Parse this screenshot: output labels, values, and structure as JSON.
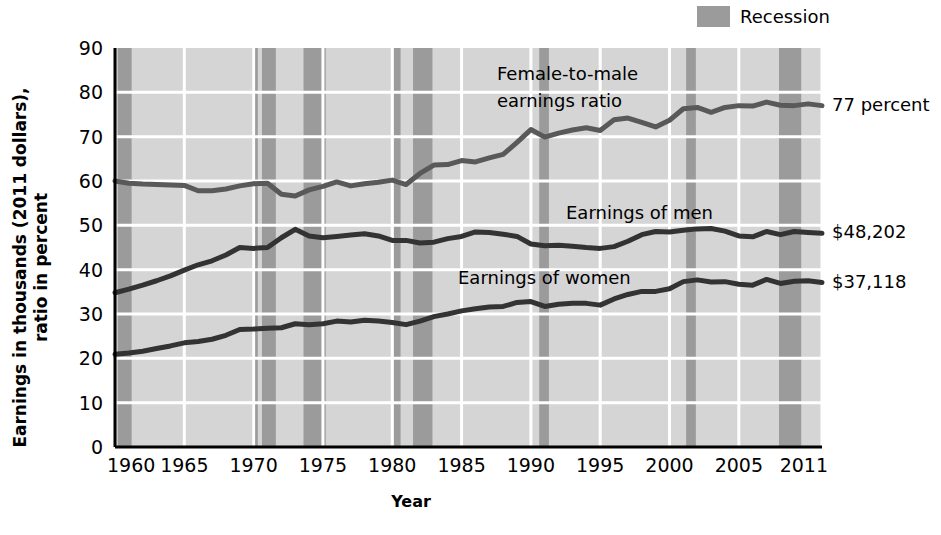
{
  "chart_data": {
    "type": "line",
    "title": "",
    "xlabel": "Year",
    "ylabel": "Earnings in thousands (2011 dollars),\nratio in percent",
    "xlim": [
      1960,
      2011
    ],
    "ylim": [
      0,
      90
    ],
    "grid": true,
    "legend_position": "top-right",
    "xticks": [
      "1960",
      "1965",
      "1970",
      "1975",
      "1980",
      "1985",
      "1990",
      "1995",
      "2000",
      "2005",
      "2011"
    ],
    "xtick_values": [
      1960,
      1965,
      1970,
      1975,
      1980,
      1985,
      1990,
      1995,
      2000,
      2005,
      2011
    ],
    "yticks": [
      "0",
      "10",
      "20",
      "30",
      "40",
      "50",
      "60",
      "70",
      "80",
      "90"
    ],
    "ytick_values": [
      0,
      10,
      20,
      30,
      40,
      50,
      60,
      70,
      80,
      90
    ],
    "legend": [
      {
        "label": "Recession",
        "color": "#9b9b9b",
        "kind": "band"
      }
    ],
    "x": [
      1960,
      1961,
      1962,
      1963,
      1964,
      1965,
      1966,
      1967,
      1968,
      1969,
      1970,
      1971,
      1972,
      1973,
      1974,
      1975,
      1976,
      1977,
      1978,
      1979,
      1980,
      1981,
      1982,
      1983,
      1984,
      1985,
      1986,
      1987,
      1988,
      1989,
      1990,
      1991,
      1992,
      1993,
      1994,
      1995,
      1996,
      1997,
      1998,
      1999,
      2000,
      2001,
      2002,
      2003,
      2004,
      2005,
      2006,
      2007,
      2008,
      2009,
      2010,
      2011
    ],
    "series": [
      {
        "name": "Female-to-male earnings ratio",
        "color": "#595959",
        "unit": "percent",
        "end_label": "77 percent",
        "values": [
          60.0,
          59.5,
          59.3,
          59.2,
          59.1,
          59.0,
          57.8,
          57.8,
          58.2,
          58.9,
          59.4,
          59.5,
          57.0,
          56.6,
          58.0,
          58.8,
          59.8,
          58.9,
          59.4,
          59.7,
          60.2,
          59.2,
          61.7,
          63.6,
          63.7,
          64.6,
          64.3,
          65.2,
          66.0,
          68.7,
          71.6,
          69.9,
          70.8,
          71.5,
          72.0,
          71.4,
          73.8,
          74.2,
          73.2,
          72.2,
          73.7,
          76.3,
          76.6,
          75.5,
          76.6,
          77.0,
          76.9,
          77.8,
          77.1,
          77.0,
          77.4,
          77.0
        ]
      },
      {
        "name": "Earnings of men",
        "color": "#333333",
        "unit": "thousands of 2011 dollars",
        "end_label": "$48,202",
        "values": [
          34.8,
          35.6,
          36.5,
          37.5,
          38.6,
          39.9,
          41.1,
          42.0,
          43.3,
          45.0,
          44.8,
          45.0,
          47.2,
          49.1,
          47.6,
          47.2,
          47.5,
          47.8,
          48.1,
          47.6,
          46.6,
          46.6,
          46.0,
          46.2,
          47.0,
          47.5,
          48.5,
          48.4,
          48.0,
          47.5,
          45.8,
          45.4,
          45.5,
          45.3,
          45.0,
          44.8,
          45.2,
          46.4,
          47.9,
          48.6,
          48.5,
          48.9,
          49.2,
          49.3,
          48.7,
          47.6,
          47.4,
          48.6,
          47.9,
          48.6,
          48.4,
          48.2
        ]
      },
      {
        "name": "Earnings of women",
        "color": "#333333",
        "unit": "thousands of 2011 dollars",
        "end_label": "$37,118",
        "values": [
          20.9,
          21.2,
          21.6,
          22.2,
          22.8,
          23.5,
          23.8,
          24.3,
          25.2,
          26.5,
          26.6,
          26.8,
          26.9,
          27.8,
          27.6,
          27.8,
          28.4,
          28.2,
          28.6,
          28.4,
          28.1,
          27.6,
          28.4,
          29.4,
          30.0,
          30.7,
          31.2,
          31.6,
          31.7,
          32.6,
          32.8,
          31.7,
          32.2,
          32.4,
          32.4,
          32.0,
          33.4,
          34.4,
          35.1,
          35.1,
          35.7,
          37.3,
          37.7,
          37.2,
          37.3,
          36.7,
          36.5,
          37.8,
          36.9,
          37.4,
          37.5,
          37.1
        ]
      }
    ],
    "recessions": [
      {
        "start": 1960.2,
        "end": 1961.2
      },
      {
        "start": 1969.9,
        "end": 1970.3
      },
      {
        "start": 1970.6,
        "end": 1971.6
      },
      {
        "start": 1973.6,
        "end": 1975.2
      },
      {
        "start": 1980.1,
        "end": 1980.6
      },
      {
        "start": 1981.5,
        "end": 1982.9
      },
      {
        "start": 1990.6,
        "end": 1991.3
      },
      {
        "start": 2001.2,
        "end": 2001.9
      },
      {
        "start": 2007.9,
        "end": 2009.5
      }
    ],
    "annotations": [
      {
        "text": "Female-to-male\nearnings ratio",
        "x_px": 497,
        "y_px": 60
      },
      {
        "text": "Earnings of men",
        "x_px": 566,
        "y_px": 199
      },
      {
        "text": "Earnings of women",
        "x_px": 458,
        "y_px": 264
      }
    ],
    "colors": {
      "plot_background": "#d5d5d5",
      "recession_band": "#9b9b9b",
      "gridline": "#ffffff",
      "axis": "#000000",
      "ratio_line": "#595959",
      "earnings_line": "#333333"
    }
  }
}
